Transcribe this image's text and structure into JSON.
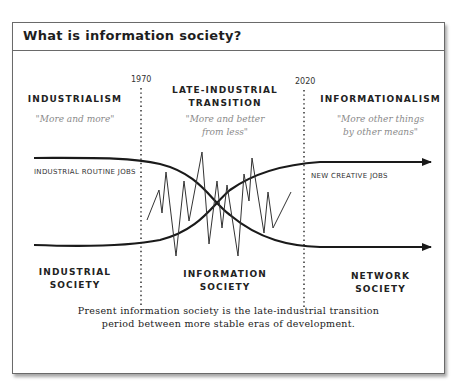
{
  "panel": {
    "title": "What is information society?"
  },
  "eras": [
    {
      "name": "INDUSTRIALISM",
      "quote": "\"More and more\"",
      "society": [
        "INDUSTRIAL",
        "SOCIETY"
      ]
    },
    {
      "name": [
        "LATE-INDUSTRIAL",
        "TRANSITION"
      ],
      "quote": [
        "\"More and better",
        "from less\""
      ],
      "society": [
        "INFORMATION",
        "SOCIETY"
      ]
    },
    {
      "name": "INFORMATIONALISM",
      "quote": [
        "\"More other things",
        "by other means\""
      ],
      "society": [
        "NETWORK",
        "SOCIETY"
      ]
    }
  ],
  "years": {
    "start": "1970",
    "end": "2020"
  },
  "curves": {
    "declining": "INDUSTRIAL ROUTINE JOBS",
    "rising": "NEW CREATIVE JOBS"
  },
  "caption": [
    "Present information society is the late-industrial transition",
    "period between more stable eras of development."
  ],
  "colors": {
    "line": "#1a1a1a",
    "border": "#6a6a6a",
    "quote": "#8a8a8a"
  }
}
